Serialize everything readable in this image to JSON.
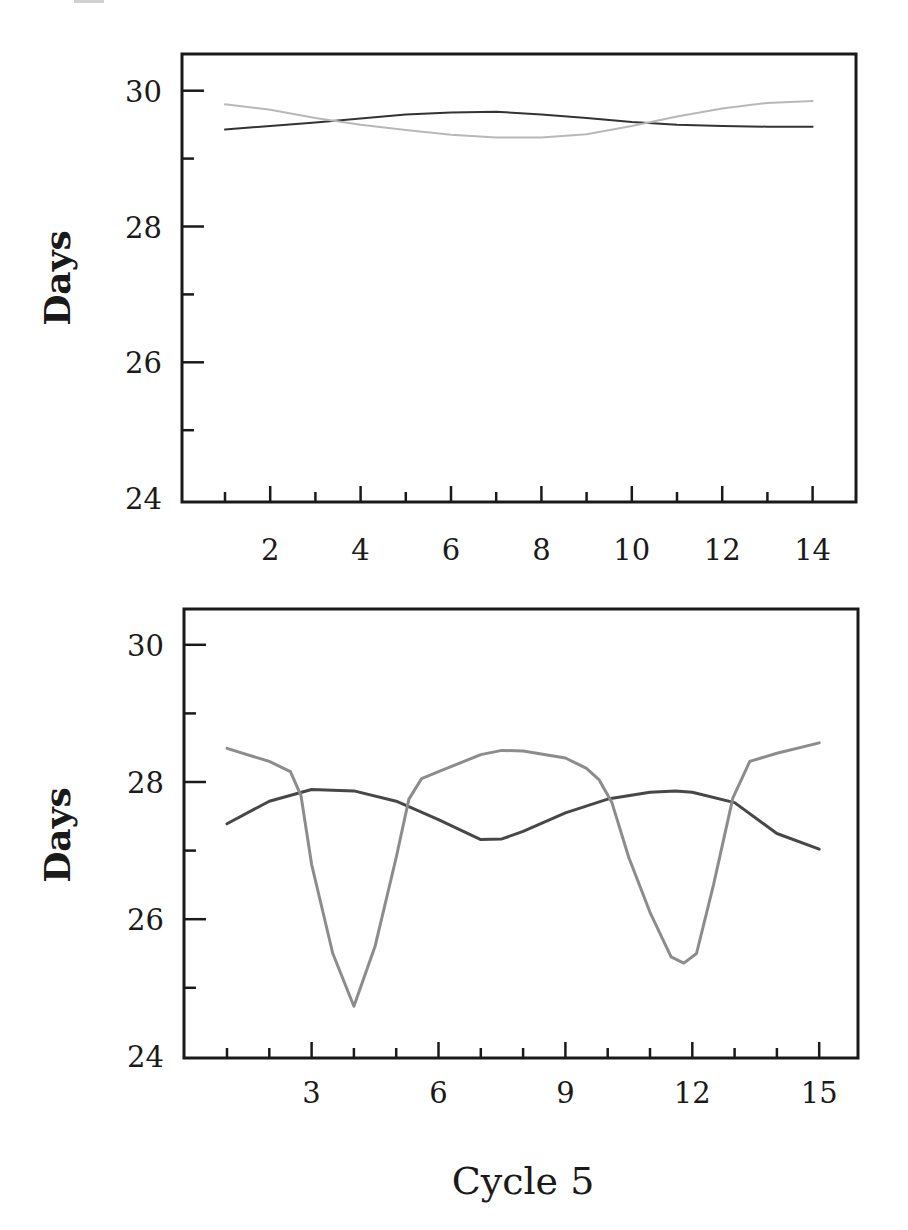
{
  "figure": {
    "width": 908,
    "height": 1230,
    "xlabel": "Cycle 5"
  },
  "chart_data": [
    {
      "type": "line",
      "panel": "top",
      "title": "",
      "xlabel": "",
      "ylabel": "Days",
      "xlim": [
        0.1,
        15
      ],
      "ylim": [
        24,
        30.5
      ],
      "grid": false,
      "legend": null,
      "x_major_ticks": [
        2,
        4,
        6,
        8,
        10,
        12,
        14
      ],
      "x_minor_ticks": [
        1,
        3,
        5,
        7,
        9,
        11,
        13
      ],
      "x_tick_labels": [
        "2",
        "4",
        "6",
        "8",
        "10",
        "12",
        "14"
      ],
      "y_major_ticks": [
        24,
        26,
        28,
        30
      ],
      "y_minor_ticks": [
        25,
        27,
        29
      ],
      "y_tick_labels": [
        "24",
        "26",
        "28",
        "30"
      ],
      "series": [
        {
          "name": "dark",
          "color": "#333333",
          "width": 2,
          "x": [
            1,
            2,
            3,
            4,
            5,
            6,
            7,
            8,
            9,
            10,
            11,
            12,
            13,
            14
          ],
          "values": [
            29.43,
            29.48,
            29.53,
            29.59,
            29.65,
            29.68,
            29.69,
            29.65,
            29.6,
            29.54,
            29.5,
            29.48,
            29.47,
            29.47
          ]
        },
        {
          "name": "light",
          "color": "#b8b8b8",
          "width": 2,
          "x": [
            1,
            2,
            3,
            4,
            5,
            6,
            7,
            8,
            9,
            10,
            11,
            12,
            13,
            14
          ],
          "values": [
            29.8,
            29.72,
            29.6,
            29.5,
            29.42,
            29.35,
            29.31,
            29.31,
            29.36,
            29.48,
            29.62,
            29.74,
            29.82,
            29.85
          ]
        }
      ]
    },
    {
      "type": "line",
      "panel": "bottom",
      "title": "",
      "xlabel": "Cycle 5",
      "ylabel": "Days",
      "xlim": [
        -0.1,
        15.9
      ],
      "ylim": [
        24,
        30.5
      ],
      "grid": false,
      "legend": null,
      "x_major_ticks": [
        3,
        6,
        9,
        12,
        15
      ],
      "x_minor_ticks": [
        1,
        2,
        4,
        5,
        7,
        8,
        10,
        11,
        13,
        14
      ],
      "x_tick_labels": [
        "3",
        "6",
        "9",
        "12",
        "15"
      ],
      "y_major_ticks": [
        24,
        26,
        28,
        30
      ],
      "y_minor_ticks": [
        25,
        27,
        29
      ],
      "y_tick_labels": [
        "24",
        "26",
        "28",
        "30"
      ],
      "series": [
        {
          "name": "dark",
          "color": "#474747",
          "width": 3,
          "x": [
            1,
            2,
            3,
            4,
            5,
            6,
            7,
            7.5,
            8,
            9,
            10,
            11,
            11.6,
            12,
            13,
            14,
            15
          ],
          "values": [
            27.39,
            27.72,
            27.89,
            27.87,
            27.72,
            27.45,
            27.16,
            27.17,
            27.28,
            27.55,
            27.75,
            27.85,
            27.87,
            27.85,
            27.7,
            27.25,
            27.02
          ]
        },
        {
          "name": "light",
          "color": "#8c8c8c",
          "width": 3,
          "x": [
            1,
            2,
            2.5,
            2.75,
            3.0,
            3.5,
            4.0,
            4.5,
            5.0,
            5.3,
            5.6,
            6,
            7,
            7.5,
            8,
            9,
            9.5,
            9.8,
            10.1,
            10.5,
            11,
            11.5,
            11.8,
            12.1,
            12.5,
            12.96,
            13.36,
            14,
            15
          ],
          "values": [
            28.49,
            28.3,
            28.15,
            27.8,
            26.8,
            25.5,
            24.73,
            25.6,
            26.9,
            27.75,
            28.05,
            28.15,
            28.4,
            28.46,
            28.45,
            28.35,
            28.2,
            28.03,
            27.7,
            26.9,
            26.1,
            25.45,
            25.36,
            25.5,
            26.5,
            27.77,
            28.3,
            28.42,
            28.57
          ]
        }
      ]
    }
  ],
  "panels": {
    "top": {
      "ylabel": "Days"
    },
    "bottom": {
      "ylabel": "Days",
      "xlabel": "Cycle 5"
    }
  }
}
